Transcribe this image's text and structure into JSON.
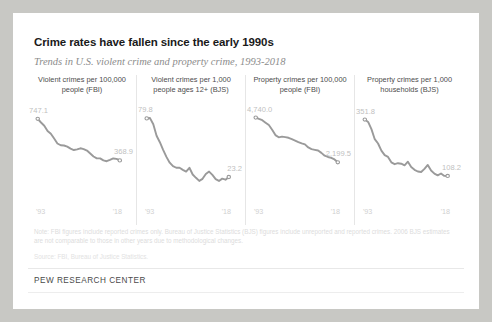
{
  "header": {
    "title": "Crime rates have fallen since the early 1990s",
    "subtitle": "Trends in U.S. violent crime and property crime, 1993-2018"
  },
  "note": "Note: FBI figures include reported crimes only. Bureau of Justice Statistics (BJS) figures include unreported and reported crimes. 2006 BJS estimates are not comparable to those in other years due to methodological changes.",
  "source": "Source: FBI, Bureau of Justice Statistics.",
  "footer": "PEW RESEARCH CENTER",
  "axis": {
    "start_tick": "'93",
    "end_tick": "'18"
  },
  "colors": {
    "line": "#9a9a9a",
    "label": "#bfbfbf",
    "title_text": "#1a1a1a",
    "subtitle_text": "#8c8c8c",
    "card_bg": "#ffffff",
    "page_bg": "#c8c8c4",
    "divider": "#e6e6e6"
  },
  "chart_data": [
    {
      "type": "line",
      "title": "Violent crimes per 100,000 people (FBI)",
      "xlabel": "",
      "ylabel": "",
      "grid": false,
      "legend": "none",
      "start_label": "747.1",
      "end_label": "368.9",
      "xlim": [
        1993,
        2018
      ],
      "ylim": [
        0,
        800
      ],
      "x": [
        1993,
        1994,
        1995,
        1996,
        1997,
        1998,
        1999,
        2000,
        2001,
        2002,
        2003,
        2004,
        2005,
        2006,
        2007,
        2008,
        2009,
        2010,
        2011,
        2012,
        2013,
        2014,
        2015,
        2016,
        2017,
        2018
      ],
      "values": [
        747.1,
        713.6,
        684.5,
        636.6,
        611.0,
        567.6,
        523.0,
        506.5,
        504.5,
        494.4,
        475.8,
        463.2,
        469.0,
        479.3,
        471.8,
        458.6,
        431.9,
        404.5,
        387.1,
        387.8,
        369.1,
        361.6,
        373.7,
        386.6,
        382.9,
        368.9
      ]
    },
    {
      "type": "line",
      "title": "Violent crimes per 1,000 people ages 12+ (BJS)",
      "xlabel": "",
      "ylabel": "",
      "grid": false,
      "legend": "none",
      "start_label": "79.8",
      "end_label": "23.2",
      "xlim": [
        1993,
        2018
      ],
      "ylim": [
        0,
        85
      ],
      "x": [
        1993,
        1994,
        1995,
        1996,
        1997,
        1998,
        1999,
        2000,
        2001,
        2002,
        2003,
        2004,
        2005,
        2006,
        2007,
        2008,
        2009,
        2010,
        2011,
        2012,
        2013,
        2014,
        2015,
        2016,
        2017,
        2018
      ],
      "values": [
        79.8,
        80.1,
        74.1,
        63.0,
        56.8,
        49.4,
        42.6,
        37.0,
        33.7,
        32.1,
        32.1,
        30.1,
        28.4,
        32.1,
        25.6,
        22.4,
        19.4,
        21.4,
        26.1,
        28.4,
        25.2,
        21.1,
        19.4,
        21.6,
        20.6,
        23.2
      ]
    },
    {
      "type": "line",
      "title": "Property crimes per 100,000 people (FBI)",
      "xlabel": "",
      "ylabel": "",
      "grid": false,
      "legend": "none",
      "start_label": "4,740.0",
      "end_label": "2,199.5",
      "xlim": [
        1993,
        2018
      ],
      "ylim": [
        0,
        5000
      ],
      "x": [
        1993,
        1994,
        1995,
        1996,
        1997,
        1998,
        1999,
        2000,
        2001,
        2002,
        2003,
        2004,
        2005,
        2006,
        2007,
        2008,
        2009,
        2010,
        2011,
        2012,
        2013,
        2014,
        2015,
        2016,
        2017,
        2018
      ],
      "values": [
        4740.0,
        4660.2,
        4590.5,
        4451.0,
        4316.3,
        4052.5,
        3743.6,
        3618.3,
        3658.1,
        3630.6,
        3591.2,
        3514.1,
        3431.5,
        3346.6,
        3276.4,
        3214.6,
        3041.3,
        2945.9,
        2905.4,
        2868.0,
        2733.6,
        2574.1,
        2500.5,
        2451.6,
        2362.2,
        2199.5
      ]
    },
    {
      "type": "line",
      "title": "Property crimes per 1,000 households (BJS)",
      "xlabel": "",
      "ylabel": "",
      "grid": false,
      "legend": "none",
      "start_label": "351.8",
      "end_label": "108.2",
      "xlim": [
        1993,
        2018
      ],
      "ylim": [
        0,
        380
      ],
      "x": [
        1993,
        1994,
        1995,
        1996,
        1997,
        1998,
        1999,
        2000,
        2001,
        2002,
        2003,
        2004,
        2005,
        2006,
        2007,
        2008,
        2009,
        2010,
        2011,
        2012,
        2013,
        2014,
        2015,
        2016,
        2017,
        2018
      ],
      "values": [
        351.8,
        341.5,
        310.2,
        266.9,
        248.3,
        217.4,
        198.0,
        190.4,
        166.9,
        159.0,
        163.2,
        161.1,
        154.1,
        169.7,
        146.5,
        134.7,
        127.4,
        125.4,
        138.7,
        155.8,
        131.4,
        118.1,
        110.7,
        118.6,
        108.4,
        108.2
      ]
    }
  ]
}
